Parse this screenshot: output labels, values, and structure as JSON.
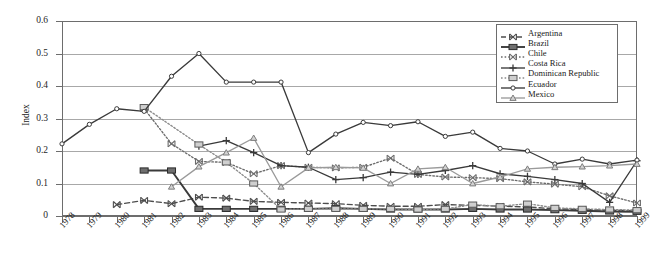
{
  "chart_data": {
    "type": "line",
    "title": "",
    "subtitle": "",
    "xlabel": "",
    "ylabel": "Index",
    "ylim": [
      0,
      0.6
    ],
    "ytick_values": [
      0,
      0.1,
      0.2,
      0.3,
      0.4,
      0.5,
      0.6
    ],
    "ytick_labels": [
      "0",
      "0.1",
      "0.2",
      "0.3",
      "0.4",
      "0.5",
      "0.6"
    ],
    "grid": true,
    "legend_position": "top-right",
    "categories": [
      1978,
      1979,
      1980,
      1981,
      1982,
      1983,
      1984,
      1985,
      1986,
      1987,
      1988,
      1989,
      1990,
      1991,
      1992,
      1993,
      1994,
      1995,
      1996,
      1997,
      1998,
      1999
    ],
    "xtick_labels": [
      "1978",
      "1979",
      "1980",
      "1981",
      "1982",
      "1983",
      "1984",
      "1985",
      "1986",
      "1987",
      "1988",
      "1989",
      "1990",
      "1991",
      "1992",
      "1993",
      "1994",
      "1995",
      "1996",
      "1997",
      "1998",
      "1999"
    ],
    "series": [
      {
        "name": "Argentina",
        "marker": "x-bowtie",
        "line": "dashed",
        "color": "#4d4d4d",
        "x": [
          1980,
          1981,
          1982,
          1983,
          1984,
          1985,
          1986,
          1987,
          1988,
          1989,
          1990,
          1991,
          1992,
          1993,
          1994,
          1995,
          1996,
          1997,
          1998,
          1999
        ],
        "values": [
          0.035,
          0.048,
          0.038,
          0.058,
          0.055,
          0.045,
          0.042,
          0.04,
          0.038,
          0.033,
          0.03,
          0.03,
          0.035,
          0.033,
          0.03,
          0.028,
          0.022,
          0.02,
          0.018,
          0.016
        ]
      },
      {
        "name": "Brazil",
        "marker": "filled-square",
        "line": "solid",
        "color": "#3a3a3a",
        "x": [
          1981,
          1982,
          1983,
          1984,
          1985,
          1986,
          1987,
          1988,
          1989,
          1990,
          1991,
          1992,
          1993,
          1994,
          1995,
          1996,
          1997,
          1998,
          1999
        ],
        "values": [
          0.14,
          0.14,
          0.022,
          0.022,
          0.022,
          0.022,
          0.022,
          0.024,
          0.022,
          0.02,
          0.02,
          0.02,
          0.022,
          0.02,
          0.02,
          0.018,
          0.016,
          0.014,
          0.013
        ]
      },
      {
        "name": "Chile",
        "marker": "x-bowtie",
        "line": "dotted",
        "color": "#6b6b6b",
        "x": [
          1981,
          1982,
          1983,
          1984,
          1985,
          1986,
          1987,
          1988,
          1989,
          1990,
          1991,
          1992,
          1993,
          1994,
          1995,
          1996,
          1997,
          1998,
          1999
        ],
        "values": [
          0.33,
          0.222,
          0.168,
          0.165,
          0.13,
          0.155,
          0.15,
          0.148,
          0.15,
          0.178,
          0.128,
          0.12,
          0.118,
          0.115,
          0.105,
          0.098,
          0.09,
          0.062,
          0.04
        ]
      },
      {
        "name": "Costa Rica",
        "marker": "plus",
        "line": "solid",
        "color": "#3a3a3a",
        "x": [
          1983,
          1984,
          1985,
          1986,
          1987,
          1988,
          1989,
          1990,
          1991,
          1992,
          1993,
          1994,
          1995,
          1996,
          1997,
          1998,
          1999
        ],
        "values": [
          0.215,
          0.232,
          0.195,
          0.155,
          0.15,
          0.112,
          0.118,
          0.135,
          0.128,
          0.14,
          0.155,
          0.13,
          0.122,
          0.112,
          0.1,
          0.042,
          0.17
        ]
      },
      {
        "name": "Dominican Republic",
        "marker": "light-square",
        "line": "dotted",
        "color": "#8a8a8a",
        "x": [
          1981,
          1983,
          1984,
          1985,
          1986,
          1987,
          1988,
          1989,
          1990,
          1991,
          1992,
          1993,
          1994,
          1995,
          1996,
          1997,
          1998,
          1999
        ],
        "values": [
          0.335,
          0.22,
          0.165,
          0.1,
          0.02,
          0.022,
          0.022,
          0.022,
          0.022,
          0.02,
          0.022,
          0.035,
          0.03,
          0.038,
          0.025,
          0.022,
          0.02,
          0.018
        ]
      },
      {
        "name": "Ecuador",
        "marker": "open-circle",
        "line": "solid",
        "color": "#3a3a3a",
        "x": [
          1978,
          1979,
          1980,
          1981,
          1982,
          1983,
          1984,
          1985,
          1986,
          1987,
          1988,
          1989,
          1990,
          1991,
          1992,
          1993,
          1994,
          1995,
          1996,
          1997,
          1998,
          1999
        ],
        "values": [
          0.222,
          0.282,
          0.33,
          0.322,
          0.43,
          0.5,
          0.412,
          0.412,
          0.412,
          0.195,
          0.252,
          0.288,
          0.278,
          0.29,
          0.245,
          0.258,
          0.208,
          0.2,
          0.16,
          0.175,
          0.16,
          0.172
        ]
      },
      {
        "name": "Mexico",
        "marker": "triangle",
        "line": "solid",
        "color": "#9a9a9a",
        "x": [
          1982,
          1983,
          1984,
          1985,
          1986,
          1987,
          1988,
          1989,
          1990,
          1991,
          1992,
          1993,
          1994,
          1995,
          1996,
          1997,
          1998,
          1999
        ],
        "values": [
          0.09,
          0.152,
          0.195,
          0.24,
          0.09,
          0.148,
          0.15,
          0.148,
          0.1,
          0.145,
          0.15,
          0.1,
          0.12,
          0.145,
          0.15,
          0.152,
          0.155,
          0.16
        ]
      }
    ]
  },
  "legend": {
    "entries": [
      {
        "label": "Argentina"
      },
      {
        "label": "Brazil"
      },
      {
        "label": "Chile"
      },
      {
        "label": "Costa Rica"
      },
      {
        "label": "Dominican Republic"
      },
      {
        "label": "Ecuador"
      },
      {
        "label": "Mexico"
      }
    ]
  }
}
